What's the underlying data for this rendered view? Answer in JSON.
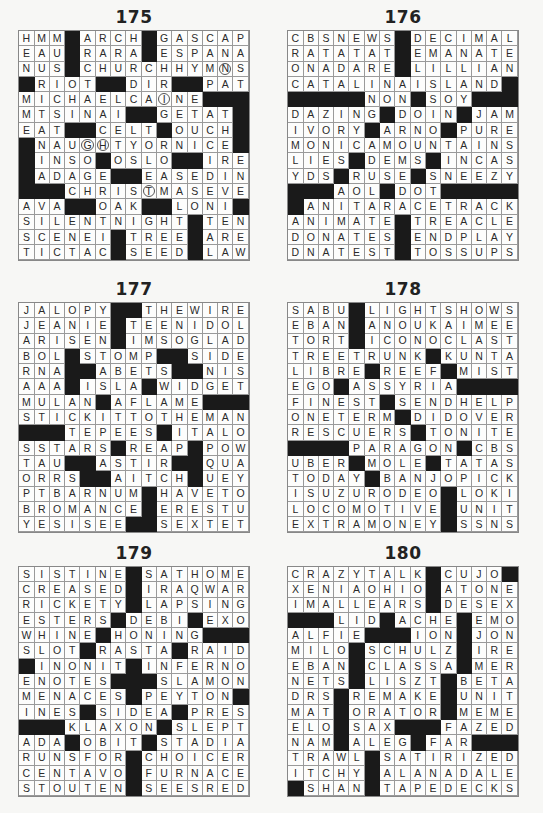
{
  "puzzles": [
    {
      "number": "175",
      "grid": [
        "HMM#ARCH#GASCAP",
        "EAU#RARA#ESPANA",
        "NUS#CHURCHHYMNS",
        "#RIOT##DIR##PAT",
        "MICHAELCAINE###",
        "MTSINAI##GETAT#",
        "EAT##CELT#OUCH#",
        "#NAUGHTYORNICE#",
        "#INSO#OSLO##IRE",
        "#ADAGE##EASEDIN",
        "###CHRISTMASEVE",
        "AVA##OAK##LONI#",
        "SILENTNIGHT#TEN",
        "SCENEI#TREE#ARE",
        "TICTAC#SEED#LAW"
      ],
      "circles": [
        [
          2,
          13
        ],
        [
          4,
          9
        ],
        [
          7,
          4
        ],
        [
          7,
          5
        ],
        [
          10,
          8
        ]
      ]
    },
    {
      "number": "176",
      "grid": [
        "CBSNEWS#DECIMAL",
        "RATATAT#EMANATE",
        "ONADARE#LILLIAN",
        "CATALINAISLAND#",
        "#####NON#SOY###",
        "DAZING#DOIN#JAM",
        "IVORY#ARNO#PURE",
        "MONICAMOUNTAINS",
        "LIES#DEMS#INCAS",
        "YDS#RUSE#SNEEZY",
        "###AOL#DOT#####",
        "#ANITARACETRACK",
        "ANIMATE#TREACLE",
        "DONATES#ENDPLAY",
        "DNATEST#TOSSUPS"
      ],
      "circles": []
    },
    {
      "number": "177",
      "grid": [
        "JALOPY##THEWIRE",
        "JEANIE#TEENIDOL",
        "ARISEN#IMSOGLAD",
        "BOL#STOMP##SIDE",
        "RNA##ABETS##NIS",
        "AAA#ISLA#WIDGET",
        "MULAN#AFLAME###",
        "STICKITTOTHEMAN",
        "###TEPEES#ITALO",
        "SSTARS#REAP#POW",
        "TAU##ASTIR##QUA",
        "ORRS##AITCH#UEY",
        "PTBARNUM#HAVETO",
        "BROMANCE#ERESTU",
        "YESISEE##SEXTET"
      ],
      "circles": []
    },
    {
      "number": "178",
      "grid": [
        "SABU#LIGHTSHOWS",
        "EBAN#ANOUKAIMEE",
        "TORT#ICONOCLAST",
        "TREETRUNK#KUNTA",
        "LIBRE#REEF#MIST",
        "EGO#ASSYRIA####",
        "FINEST#SENDHELP",
        "ONETERM#DIDOVER",
        "RESCUERS#TONITE",
        "####PARAGON#CBS",
        "UBER#MOLE#TATAS",
        "TODAY#BANJOPICK",
        "ISUZURODEO#LOKI",
        "LOCOMOTIVE#UNIT",
        "EXTRAMONEY#SSNS"
      ],
      "circles": []
    },
    {
      "number": "179",
      "grid": [
        "SISTINE#SATHOME",
        "CREASED#IRAQWAR",
        "RICKETY#LAPSING",
        "ESTERS#DEBI#EXO",
        "WHINE#HONING###",
        "SLOT#RASTA#RAID",
        "#INONIT#INFERNO",
        "ENOTES###SLAMON",
        "MENACES#PEYTON#",
        "INES#SIDEA#PRES",
        "###KLAXON#SLEPT",
        "ADA#OBIT#STADIA",
        "RUNSFOR#CHOICER",
        "CENTAVO#FURNACE",
        "STOUTEN#SEESRED"
      ],
      "circles": []
    },
    {
      "number": "180",
      "grid": [
        "CRAZYTALK#CUJO#",
        "XENIAOHIO#ATONE",
        "IMALLEARS#DESEX",
        "###LID#ACHE#EMO",
        "ALFIE###ION#JON",
        "MILO#SCHULZ#IRE",
        "EBAN#CLASSA#MER",
        "NETS#LISZT#BETA",
        "DRS#REMAKE#UNIT",
        "MAT#ORATOR#MEME",
        "ELO#SAX###FAZED",
        "NAM#ALEG#FAR###",
        "TRAWL#SATIRIZED",
        "ITCHY#ALANADALE",
        "#SHAN#TAPEDECKS"
      ],
      "circles": []
    }
  ],
  "colors": {
    "background": "#f7f7f5",
    "cell": "#fdfdfc",
    "black_square": "#1a1a1a",
    "grid_line": "#9a9a9a",
    "text": "#2a2a2a"
  }
}
